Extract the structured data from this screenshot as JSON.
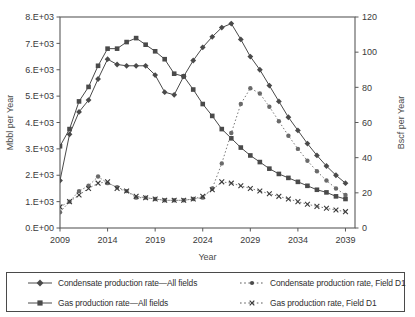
{
  "chart_data": {
    "type": "line",
    "title": "",
    "xlabel": "Year",
    "ylabel": "Mbbl per Year",
    "y2label": "Bscf per Year",
    "xlim": [
      2009,
      2040
    ],
    "ylim": [
      0,
      8000
    ],
    "y2lim": [
      0,
      120
    ],
    "grid": false,
    "legend_position": "bottom",
    "xticks": [
      2009,
      2014,
      2019,
      2024,
      2029,
      2034,
      2039
    ],
    "xtick_labels": [
      "2009",
      "2014",
      "2019",
      "2024",
      "2029",
      "2034",
      "2039"
    ],
    "yticks": [
      0,
      1000,
      2000,
      3000,
      4000,
      5000,
      6000,
      7000,
      8000
    ],
    "ytick_labels": [
      "0.E+00",
      "1.E+03",
      "2.E+03",
      "3.E+03",
      "4.E+03",
      "5.E+03",
      "6.E+03",
      "7.E+03",
      "8.E+03"
    ],
    "y2ticks": [
      0,
      20,
      40,
      60,
      80,
      100,
      120
    ],
    "y2tick_labels": [
      "0",
      "20",
      "40",
      "60",
      "80",
      "100",
      "120"
    ],
    "x": [
      2009,
      2010,
      2011,
      2012,
      2013,
      2014,
      2015,
      2016,
      2017,
      2018,
      2019,
      2020,
      2021,
      2022,
      2023,
      2024,
      2025,
      2026,
      2027,
      2028,
      2029,
      2030,
      2031,
      2032,
      2033,
      2034,
      2035,
      2036,
      2037,
      2038,
      2039
    ],
    "series": [
      {
        "name": "Condensate production rate—All fields",
        "axis": "left",
        "marker": "diamond",
        "linestyle": "solid",
        "values": [
          1800,
          3550,
          4400,
          4850,
          5650,
          6400,
          6200,
          6150,
          6150,
          6150,
          5800,
          5150,
          5050,
          5750,
          6350,
          6850,
          7250,
          7600,
          7750,
          7150,
          6500,
          6000,
          5400,
          4800,
          4200,
          3700,
          3200,
          2750,
          2350,
          2000,
          1700
        ]
      },
      {
        "name": "Gas production rate—All fields",
        "axis": "left",
        "marker": "square",
        "linestyle": "solid",
        "values": [
          3100,
          3750,
          4800,
          5350,
          6150,
          6800,
          6800,
          7050,
          7200,
          6950,
          6700,
          6400,
          5850,
          5750,
          5250,
          4700,
          4250,
          3750,
          3400,
          3050,
          2750,
          2500,
          2250,
          2050,
          1900,
          1750,
          1600,
          1450,
          1350,
          1200,
          1100
        ]
      },
      {
        "name": "Condensate production rate, Field D1",
        "axis": "left",
        "marker": "dot",
        "linestyle": "dotted",
        "values": [
          600,
          1000,
          1400,
          1600,
          1950,
          1700,
          1550,
          1400,
          1150,
          1150,
          1100,
          1050,
          1050,
          1050,
          1100,
          1150,
          1500,
          2450,
          3600,
          4700,
          5300,
          5100,
          4600,
          4050,
          3500,
          3000,
          2550,
          2150,
          1800,
          1500,
          1250
        ]
      },
      {
        "name": "Gas production rate, Field D1",
        "axis": "left",
        "marker": "cross",
        "linestyle": "dotted",
        "values": [
          800,
          1000,
          1250,
          1500,
          1700,
          1750,
          1500,
          1400,
          1200,
          1150,
          1100,
          1050,
          1050,
          1050,
          1100,
          1200,
          1450,
          1750,
          1700,
          1600,
          1500,
          1400,
          1300,
          1200,
          1100,
          1000,
          900,
          820,
          750,
          680,
          620
        ]
      }
    ]
  },
  "legend": {
    "items": [
      {
        "label": "Condensate production rate—All fields",
        "marker": "diamond",
        "linestyle": "solid"
      },
      {
        "label": "Gas production rate—All fields",
        "marker": "square",
        "linestyle": "solid"
      },
      {
        "label": "Condensate production rate, Field D1",
        "marker": "dot",
        "linestyle": "dotted"
      },
      {
        "label": "Gas production rate, Field D1",
        "marker": "cross",
        "linestyle": "dotted"
      }
    ]
  },
  "colors": {
    "line": "#4a4a4a",
    "axis": "#5a5a5a",
    "text": "#2e2e2e",
    "background": "#ffffff"
  }
}
